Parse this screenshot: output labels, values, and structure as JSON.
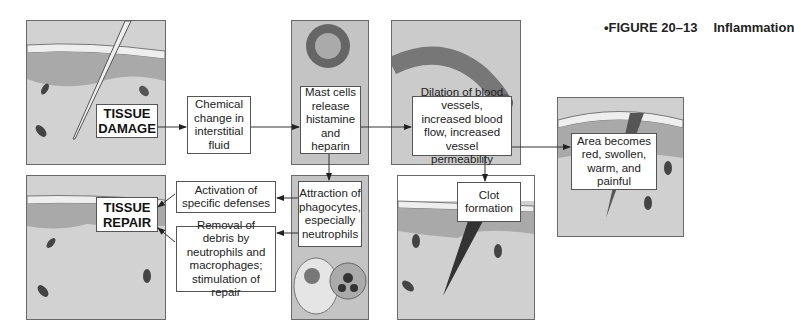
{
  "figure": {
    "label": "•FIGURE 20–13",
    "title": "Inflammation"
  },
  "nodes": {
    "tissue_damage": "TISSUE DAMAGE",
    "chemical_change": "Chemical change in interstitial fluid",
    "mast_cells": "Mast cells release histamine and heparin",
    "dilation": "Dilation of blood vessels, increased blood flow, increased vessel permeability",
    "area_becomes": "Area becomes red, swollen, warm, and painful",
    "clot": "Clot formation",
    "attraction": "Attraction of phagocytes, especially neutrophils",
    "activation": "Activation of specific defenses",
    "removal": "Removal of debris by neutrophils and macrophages; stimulation of repair",
    "tissue_repair": "TISSUE REPAIR"
  },
  "colors": {
    "tissue": "#c9c9c9",
    "epidermis": "#a9a9a9",
    "line": "#333333"
  }
}
